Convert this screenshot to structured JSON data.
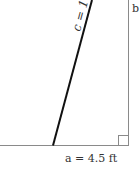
{
  "diagram": {
    "type": "right-triangle",
    "labels": {
      "hypotenuse": "c = 16",
      "side_b": "b",
      "side_a": "a = 4.5 ft"
    },
    "colors": {
      "hypotenuse": "#111111",
      "sides": "#888888",
      "text": "#333333"
    }
  }
}
